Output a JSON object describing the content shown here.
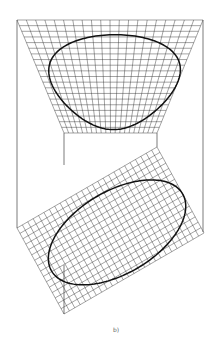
{
  "figure": {
    "caption": "b)",
    "caption_pos": {
      "x": 113,
      "y": 326
    },
    "colors": {
      "mesh": "#333333",
      "edge": "#444444",
      "curve": "#111111",
      "caption": "#666666"
    },
    "saddle": {
      "description": "hyperbolic paraboloid (ruled surface) with figure-eight curve",
      "corners": {
        "A_top_left": [
          17,
          20
        ],
        "B_bottom_left": [
          64,
          133
        ],
        "C_bottom_right": [
          157,
          133
        ],
        "D_top_right": [
          203,
          20
        ]
      },
      "grid_divisions": 20
    },
    "plane": {
      "description": "tilted planar grid with ellipse",
      "corners": {
        "L_left": [
          17,
          228
        ],
        "T_top": [
          157,
          147
        ],
        "B_bottom": [
          64,
          314
        ]
      },
      "grid_divisions_s": 26,
      "grid_divisions_t": 16
    },
    "curve": {
      "description": "ellipse in parameter space, mapped to both surfaces",
      "center": [
        0.53,
        0.55
      ],
      "radius_s": 0.47,
      "radius_t": 0.42
    },
    "verticals": [
      {
        "x": 17,
        "y1": 20,
        "y2": 228
      },
      {
        "x": 203,
        "y1": 20,
        "y2": 232
      },
      {
        "x": 64,
        "y1": 133,
        "y2": 165
      },
      {
        "x": 64,
        "y1": 265,
        "y2": 314
      },
      {
        "x": 157,
        "y1": 133,
        "y2": 147
      }
    ]
  }
}
